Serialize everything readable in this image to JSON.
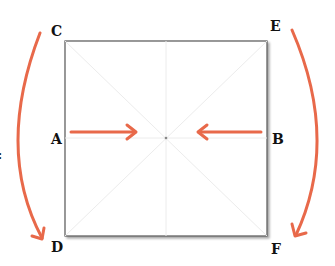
{
  "diagram": {
    "labels": {
      "C": "C",
      "E": "E",
      "A": "A",
      "B": "B",
      "D": "D",
      "F": "F"
    },
    "side_mark": ":",
    "colors": {
      "arrow": "#e8694a",
      "square_border": "#555555",
      "guide_lines": "#ececec",
      "label": "#111111"
    }
  }
}
